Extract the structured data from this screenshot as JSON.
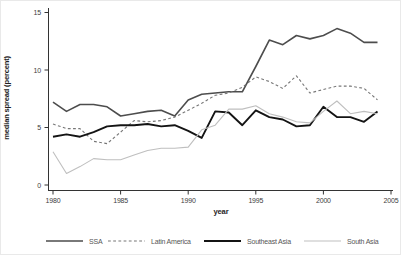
{
  "figure": {
    "background": "#ffffff",
    "axis_color": "#333333",
    "tick_label_color": "#3d3d3d",
    "legend_label_color": "#555555"
  },
  "chart_data": {
    "type": "line",
    "title": "",
    "xlabel": "year",
    "ylabel": "median spread (percent)",
    "xlim": [
      1980,
      2005
    ],
    "ylim": [
      0,
      15
    ],
    "xticks": [
      1980,
      1985,
      1990,
      1995,
      2000,
      2005
    ],
    "yticks": [
      0,
      5,
      10,
      15
    ],
    "grid": false,
    "legend_position": "bottom",
    "x": [
      1980,
      1981,
      1982,
      1983,
      1984,
      1985,
      1986,
      1987,
      1988,
      1989,
      1990,
      1991,
      1992,
      1993,
      1994,
      1995,
      1996,
      1997,
      1998,
      1999,
      2000,
      2001,
      2002,
      2003,
      2004
    ],
    "series": [
      {
        "name": "SSA",
        "color": "#4d4d4d",
        "dash": null,
        "width": 1.6,
        "values": [
          7.2,
          6.4,
          7.0,
          7.0,
          6.8,
          6.0,
          6.2,
          6.4,
          6.5,
          6.0,
          7.4,
          7.9,
          8.0,
          8.1,
          8.1,
          10.3,
          12.6,
          12.2,
          13.0,
          12.7,
          13.0,
          13.6,
          13.2,
          12.4,
          12.4
        ]
      },
      {
        "name": "Latin America",
        "color": "#777777",
        "dash": "2.8,2.4",
        "width": 1.1,
        "values": [
          5.3,
          4.9,
          4.9,
          3.8,
          3.6,
          4.6,
          5.6,
          5.5,
          5.6,
          5.9,
          6.5,
          7.1,
          7.8,
          8.0,
          8.5,
          9.4,
          9.0,
          8.4,
          9.5,
          8.0,
          8.3,
          8.6,
          8.6,
          8.4,
          7.4
        ]
      },
      {
        "name": "Southeast Asia",
        "color": "#141414",
        "dash": null,
        "width": 1.9,
        "values": [
          4.2,
          4.4,
          4.2,
          4.6,
          5.1,
          5.2,
          5.2,
          5.3,
          5.1,
          5.2,
          4.7,
          4.1,
          6.4,
          6.3,
          5.2,
          6.5,
          5.9,
          5.7,
          5.1,
          5.2,
          6.8,
          5.9,
          5.9,
          5.5,
          6.4
        ]
      },
      {
        "name": "South Asia",
        "color": "#bfbfbf",
        "dash": null,
        "width": 1.1,
        "values": [
          2.9,
          1.0,
          1.6,
          2.3,
          2.2,
          2.2,
          2.6,
          3.0,
          3.2,
          3.2,
          3.3,
          4.8,
          5.2,
          6.6,
          6.6,
          6.9,
          6.2,
          5.9,
          5.5,
          5.4,
          6.4,
          7.3,
          6.2,
          6.4,
          6.2
        ]
      }
    ]
  }
}
